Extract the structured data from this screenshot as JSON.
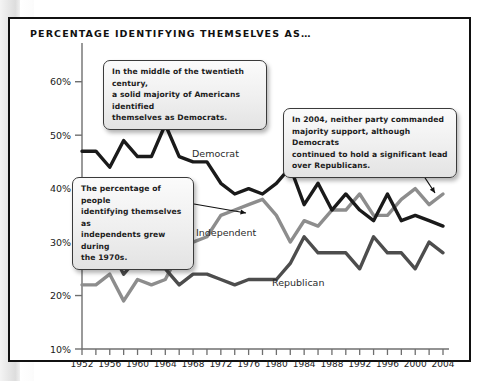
{
  "chart_title": "PERCENTAGE IDENTIFYING THEMSELVES AS…",
  "callouts": [
    {
      "id": "callout-1",
      "lines": [
        "In the middle of the twentieth century,",
        "a solid majority of Americans identified",
        "themselves as Democrats."
      ]
    },
    {
      "id": "callout-2",
      "lines": [
        "The percentage of people",
        "identifying themselves as",
        "independents grew during",
        "the 1970s."
      ]
    },
    {
      "id": "callout-3",
      "lines": [
        "In 2004, neither party commanded",
        "majority support, although Democrats",
        "continued to hold a significant lead",
        "over Republicans."
      ]
    }
  ],
  "series_labels": {
    "democrat": "Democrat",
    "independent": "Independent",
    "republican": "Republican"
  },
  "colors": {
    "democrat": "#1a1a1a",
    "independent": "#8d8d8d",
    "republican": "#4d4d4d",
    "axis": "#6f6f6f",
    "frame": "#111111"
  },
  "chart_data": {
    "type": "line",
    "title": "PERCENTAGE IDENTIFYING THEMSELVES AS…",
    "xlabel": "",
    "ylabel": "",
    "xlim": [
      1952,
      2004
    ],
    "ylim": [
      10,
      65
    ],
    "grid": false,
    "legend": "inline-labels",
    "ytick_labels": [
      "10%",
      "20%",
      "30%",
      "40%",
      "50%",
      "60%"
    ],
    "ytick_values": [
      10,
      20,
      30,
      40,
      50,
      60
    ],
    "xtick_labels": [
      "1952",
      "1956",
      "1960",
      "1964",
      "1968",
      "1972",
      "1976",
      "1980",
      "1984",
      "1988",
      "1992",
      "1996",
      "2000",
      "2004"
    ],
    "xtick_values": [
      1952,
      1956,
      1960,
      1964,
      1968,
      1972,
      1976,
      1980,
      1984,
      1988,
      1992,
      1996,
      2000,
      2004
    ],
    "minor_xticks": [
      1952,
      1954,
      1956,
      1958,
      1960,
      1962,
      1964,
      1966,
      1968,
      1970,
      1972,
      1974,
      1976,
      1978,
      1980,
      1982,
      1984,
      1986,
      1988,
      1990,
      1992,
      1994,
      1996,
      1998,
      2000,
      2002,
      2004
    ],
    "x": [
      1952,
      1954,
      1956,
      1958,
      1960,
      1962,
      1964,
      1966,
      1968,
      1970,
      1972,
      1974,
      1976,
      1978,
      1980,
      1982,
      1984,
      1986,
      1988,
      1990,
      1992,
      1994,
      1996,
      1998,
      2000,
      2002,
      2004
    ],
    "series": [
      {
        "name": "Democrat",
        "color": "#1a1a1a",
        "values": [
          47,
          47,
          44,
          49,
          46,
          46,
          52,
          46,
          45,
          45,
          41,
          39,
          40,
          39,
          41,
          44,
          37,
          41,
          36,
          39,
          36,
          34,
          39,
          34,
          35,
          34,
          33
        ]
      },
      {
        "name": "Independent",
        "color": "#8d8d8d",
        "values": [
          22,
          22,
          24,
          19,
          23,
          22,
          23,
          28,
          30,
          31,
          35,
          36,
          37,
          38,
          35,
          30,
          34,
          33,
          36,
          36,
          39,
          35,
          35,
          38,
          40,
          37,
          39
        ]
      },
      {
        "name": "Republican",
        "color": "#4d4d4d",
        "values": [
          28,
          27,
          29,
          24,
          27,
          25,
          25,
          22,
          24,
          24,
          23,
          22,
          23,
          23,
          23,
          26,
          31,
          28,
          28,
          28,
          25,
          31,
          28,
          28,
          25,
          30,
          28
        ]
      }
    ],
    "annotations": [
      "In the middle of the twentieth century, a solid majority of Americans identified themselves as Democrats.",
      "The percentage of people identifying themselves as independents grew during the 1970s.",
      "In 2004, neither party commanded majority support, although Democrats continued to hold a significant lead over Republicans."
    ]
  }
}
